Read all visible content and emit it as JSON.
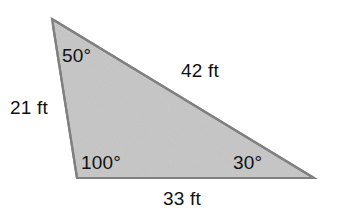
{
  "figure": {
    "background_color": "#ffffff",
    "fill_color": "#c8c8c8",
    "stroke_color": "#808080",
    "text_color": "#111111",
    "unit": "ft"
  },
  "shape": {
    "type": "triangle",
    "vertices": [
      {
        "name": "apex",
        "x": 52,
        "y": 19
      },
      {
        "name": "bottom-left",
        "x": 77,
        "y": 178
      },
      {
        "name": "bottom-right",
        "x": 314,
        "y": 178
      }
    ]
  },
  "labels": {
    "angle_apex": "50°",
    "angle_bottom_left": "100°",
    "angle_bottom_right": "30°",
    "side_left": "21 ft",
    "side_hypotenuse": "42 ft",
    "side_base": "33 ft"
  },
  "chart_data": {
    "type": "diagram",
    "angles": [
      {
        "vertex": "apex",
        "label": "50°",
        "value": 50,
        "units": "degrees"
      },
      {
        "vertex": "bottom-left",
        "label": "100°",
        "value": 100,
        "units": "degrees"
      },
      {
        "vertex": "bottom-right",
        "label": "30°",
        "value": 30,
        "units": "degrees"
      }
    ],
    "sides": [
      {
        "name": "left",
        "label": "21 ft",
        "value": 21,
        "units": "ft",
        "between": [
          "apex",
          "bottom-left"
        ]
      },
      {
        "name": "hypotenuse",
        "label": "42 ft",
        "value": 42,
        "units": "ft",
        "between": [
          "apex",
          "bottom-right"
        ]
      },
      {
        "name": "base",
        "label": "33 ft",
        "value": 33,
        "units": "ft",
        "between": [
          "bottom-left",
          "bottom-right"
        ]
      }
    ]
  }
}
